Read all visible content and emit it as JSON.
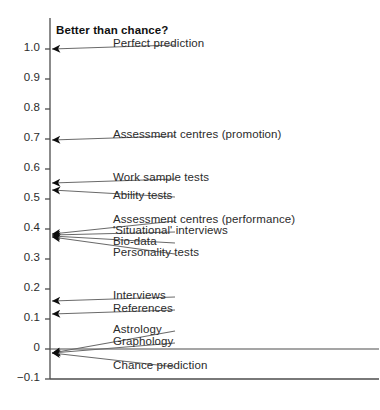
{
  "chart_data": {
    "type": "scatter",
    "title": "Better than chance?",
    "xlabel": "",
    "ylabel": "",
    "ylim": [
      -0.1,
      1.05
    ],
    "yticks": [
      "1.0",
      "0.9",
      "0.8",
      "0.7",
      "0.6",
      "0.5",
      "0.4",
      "0.3",
      "0.2",
      "0.1",
      "0",
      "−0.1"
    ],
    "ytick_values": [
      1.0,
      0.9,
      0.8,
      0.7,
      0.6,
      0.5,
      0.4,
      0.3,
      0.2,
      0.1,
      0.0,
      -0.1
    ],
    "grid": false,
    "legend": "none",
    "zero_line": true,
    "categories": [
      "Perfect prediction",
      "Assessment centres (promotion)",
      "Work sample tests",
      "Ability tests",
      "Assessment centres (performance)",
      "'Situational' interviews",
      "Bio-data",
      "Personality tests",
      "Interviews",
      "References",
      "Astrology",
      "Graphology",
      "Chance prediction"
    ],
    "values": [
      1.0,
      0.68,
      0.555,
      0.535,
      0.41,
      0.4,
      0.395,
      0.385,
      0.17,
      0.13,
      0.0,
      0.0,
      0.0
    ],
    "points": [
      {
        "label": "Perfect prediction",
        "value": 1.0,
        "marker_y": 49,
        "label_y": 49,
        "arrow": "straight"
      },
      {
        "label": "Assessment centres (promotion)",
        "value": 0.68,
        "marker_y": 140,
        "label_y": 140,
        "arrow": "straight"
      },
      {
        "label": "Work sample tests",
        "value": 0.555,
        "marker_y": 183,
        "label_y": 183,
        "arrow": "straight"
      },
      {
        "label": "Ability tests",
        "value": 0.535,
        "marker_y": 190,
        "label_y": 201,
        "arrow": "slanted"
      },
      {
        "label": "Assessment centres (performance)",
        "value": 0.41,
        "marker_y": 234,
        "label_y": 225,
        "arrow": "slanted"
      },
      {
        "label": "'Situational' interviews",
        "value": 0.4,
        "marker_y": 235,
        "label_y": 236,
        "arrow": "slanted"
      },
      {
        "label": "Bio-data",
        "value": 0.395,
        "marker_y": 236,
        "label_y": 247,
        "arrow": "slanted"
      },
      {
        "label": "Personality tests",
        "value": 0.385,
        "marker_y": 237,
        "label_y": 258,
        "arrow": "slanted"
      },
      {
        "label": "Interviews",
        "value": 0.17,
        "marker_y": 301,
        "label_y": 301,
        "arrow": "straight"
      },
      {
        "label": "References",
        "value": 0.13,
        "marker_y": 314,
        "label_y": 314,
        "arrow": "straight"
      },
      {
        "label": "Astrology",
        "value": 0.0,
        "marker_y": 353,
        "label_y": 335,
        "arrow": "slanted"
      },
      {
        "label": "Graphology",
        "value": 0.0,
        "marker_y": 353,
        "label_y": 347,
        "arrow": "slanted"
      },
      {
        "label": "Chance prediction",
        "value": 0.0,
        "marker_y": 353,
        "label_y": 371,
        "arrow": "slanted"
      }
    ],
    "colors": {
      "axis": "#4d4d4d",
      "marker": "#0d0d0d",
      "leader": "#6a6a6a",
      "text": "#2b2b2b",
      "title": "#111111",
      "background": "#ffffff"
    }
  }
}
